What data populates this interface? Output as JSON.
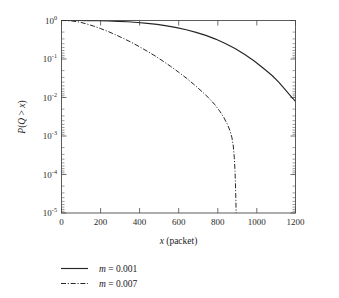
{
  "chart_data": {
    "type": "line",
    "title": "",
    "xlabel": "x (packet)",
    "ylabel": "P(Q > x)",
    "xlim": [
      0,
      1250
    ],
    "ylim": [
      1e-05,
      1
    ],
    "yscale": "log",
    "xscale": "linear",
    "grid": false,
    "legend_position": "below-left",
    "xticks": [
      0,
      200,
      400,
      600,
      800,
      1000,
      1200
    ],
    "xtick_labels": [
      "0",
      "200",
      "400",
      "600",
      "800",
      "1000",
      "1200"
    ],
    "yticks": [
      1,
      0.1,
      0.01,
      0.001,
      0.0001,
      1e-05
    ],
    "ytick_labels": [
      "10^0",
      "10^-1",
      "10^-2",
      "10^-3",
      "10^-4",
      "10^-5"
    ],
    "ytick_mantissas": [
      "10",
      "10",
      "10",
      "10",
      "10",
      "10"
    ],
    "ytick_exponents": [
      "0",
      "-1",
      "-2",
      "-3",
      "-4",
      "-5"
    ],
    "series": [
      {
        "name": "m = 0.001",
        "style": "solid",
        "color": "#262626",
        "x": [
          0,
          40,
          90,
          140,
          190,
          240,
          290,
          340,
          390,
          440,
          490,
          540,
          590,
          640,
          690,
          740,
          790,
          840,
          890,
          940,
          990,
          1040,
          1080,
          1115,
          1145,
          1168,
          1182,
          1190,
          1194,
          1196,
          1197
        ],
        "y": [
          1.0,
          1.0,
          0.998,
          0.993,
          0.985,
          0.972,
          0.952,
          0.925,
          0.89,
          0.845,
          0.79,
          0.726,
          0.654,
          0.575,
          0.493,
          0.41,
          0.329,
          0.254,
          0.187,
          0.131,
          0.0875,
          0.0548,
          0.0372,
          0.0248,
          0.0166,
          0.0121,
          0.00995,
          0.00905,
          0.0086,
          0.00835,
          0.0082
        ]
      },
      {
        "name": "m = 0.007",
        "style": "dashdot",
        "color": "#262626",
        "x": [
          0,
          25,
          50,
          75,
          100,
          130,
          165,
          200,
          240,
          280,
          320,
          360,
          400,
          440,
          480,
          520,
          560,
          600,
          640,
          680,
          720,
          755,
          785,
          810,
          832,
          850,
          864,
          874,
          881,
          886,
          890,
          893,
          895,
          896
        ],
        "y": [
          1.0,
          0.995,
          0.975,
          0.94,
          0.89,
          0.81,
          0.715,
          0.62,
          0.515,
          0.42,
          0.338,
          0.268,
          0.208,
          0.159,
          0.12,
          0.0885,
          0.0642,
          0.0457,
          0.0319,
          0.0217,
          0.0143,
          0.00975,
          0.00665,
          0.00455,
          0.00305,
          0.00205,
          0.00138,
          0.00091,
          0.00055,
          0.00028,
          0.00012,
          4e-05,
          1.4e-05,
          1e-05
        ]
      }
    ]
  },
  "legend": {
    "entries": [
      {
        "label_var": "m",
        "label_eq": "= 0.001",
        "full": "m = 0.001",
        "style": "solid"
      },
      {
        "label_var": "m",
        "label_eq": "= 0.007",
        "full": "m = 0.007",
        "style": "dash-dot"
      }
    ]
  },
  "axes": {
    "x_title_var": "x",
    "x_title_rest": "(packet)",
    "y_title_parts": {
      "p": "P",
      "open": "(",
      "q": "Q",
      "gt": " > ",
      "x": "x",
      "close": ")"
    }
  }
}
